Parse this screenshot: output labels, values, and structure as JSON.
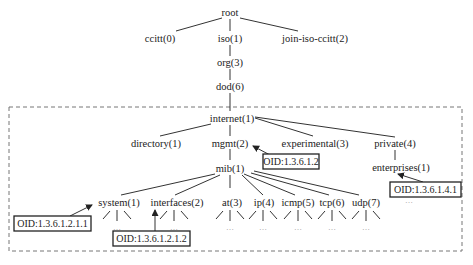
{
  "diagram": {
    "type": "OID tree",
    "nodes": {
      "root": "root",
      "ccitt": "ccitt(0)",
      "iso": "iso(1)",
      "joint": "join-iso-ccitt(2)",
      "org": "org(3)",
      "dod": "dod(6)",
      "internet": "internet(1)",
      "directory": "directory(1)",
      "mgmt": "mgmt(2)",
      "experimental": "experimental(3)",
      "private": "private(4)",
      "enterprises": "enterprises(1)",
      "mib": "mib(1)",
      "system": "system(1)",
      "interfaces": "interfaces(2)",
      "at": "at(3)",
      "ip": "ip(4)",
      "icmp": "icmp(5)",
      "tcp": "tcp(6)",
      "udp": "udp(7)"
    },
    "callouts": {
      "mgmt_oid": "OID:1.3.6.1.2",
      "enterprises_oid": "OID:1.3.6.1.4.1",
      "system_oid": "OID:1.3.6.1.2.1.1",
      "interfaces_oid": "OID:1.3.6.1.2.1.2"
    },
    "ellipsis": "…",
    "colors": {
      "line": "#333333",
      "text": "#222222",
      "dashed_border": "#777777"
    }
  }
}
